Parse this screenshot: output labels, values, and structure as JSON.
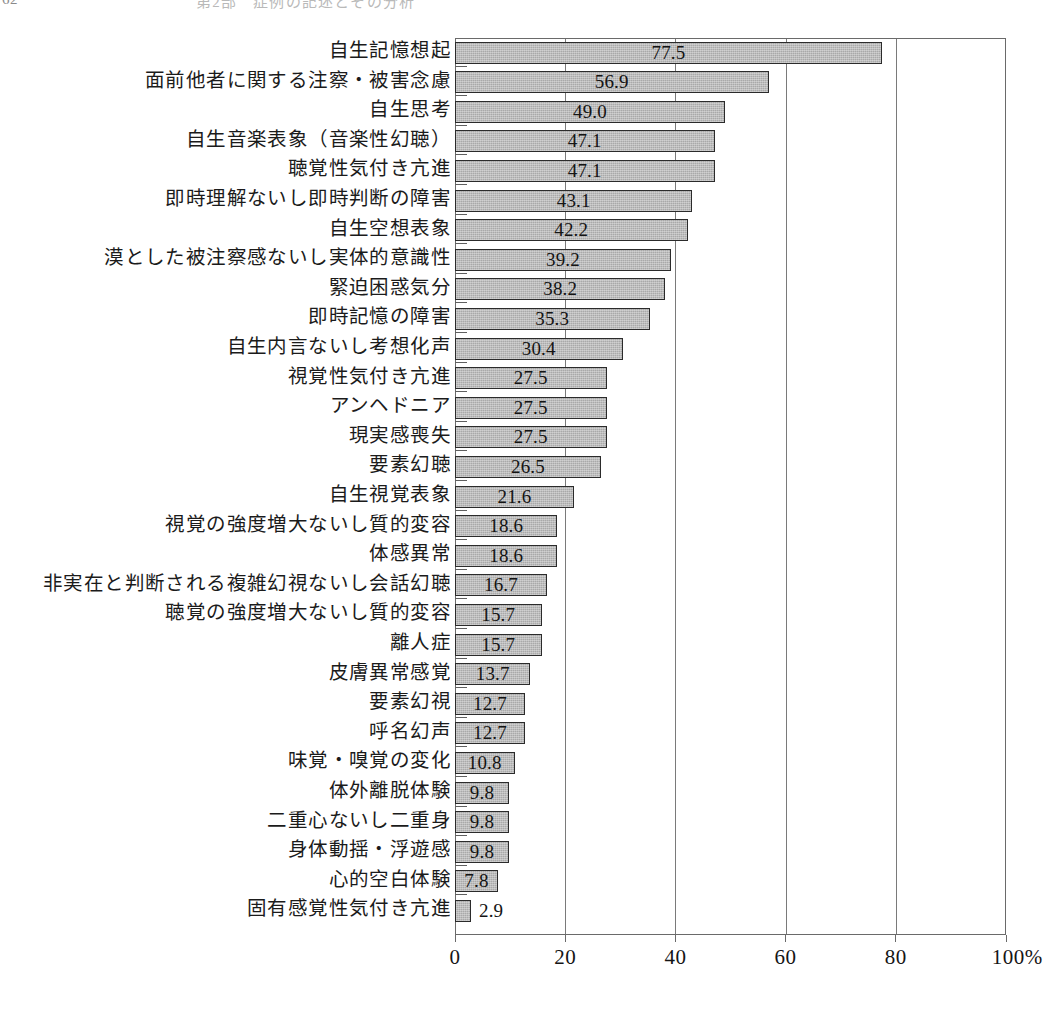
{
  "page_header": {
    "folio": "62",
    "running_title": "第2部　症例の記述とその分析"
  },
  "chart_data": {
    "type": "bar",
    "orientation": "horizontal",
    "title": "",
    "xlabel": "",
    "ylabel": "",
    "xlim": [
      0,
      100
    ],
    "xticks": [
      0,
      20,
      40,
      60,
      80,
      100
    ],
    "xtick_labels": [
      "0",
      "20",
      "40",
      "60",
      "80",
      "100%"
    ],
    "unit": "%",
    "grid": true,
    "grid_axis": "x",
    "legend": false,
    "bar_fill_color": "#a9a9a9",
    "bar_border_color": "#2b2b2b",
    "sorted": "descending",
    "categories": [
      "自生記憶想起",
      "面前他者に関する注察・被害念慮",
      "自生思考",
      "自生音楽表象（音楽性幻聴）",
      "聴覚性気付き亢進",
      "即時理解ないし即時判断の障害",
      "自生空想表象",
      "漠とした被注察感ないし実体的意識性",
      "緊迫困惑気分",
      "即時記憶の障害",
      "自生内言ないし考想化声",
      "視覚性気付き亢進",
      "アンヘドニア",
      "現実感喪失",
      "要素幻聴",
      "自生視覚表象",
      "視覚の強度増大ないし質的変容",
      "体感異常",
      "非実在と判断される複雑幻視ないし会話幻聴",
      "聴覚の強度増大ないし質的変容",
      "離人症",
      "皮膚異常感覚",
      "要素幻視",
      "呼名幻声",
      "味覚・嗅覚の変化",
      "体外離脱体験",
      "二重心ないし二重身",
      "身体動揺・浮遊感",
      "心的空白体験",
      "固有感覚性気付き亢進"
    ],
    "values": [
      77.5,
      56.9,
      49.0,
      47.1,
      47.1,
      43.1,
      42.2,
      39.2,
      38.2,
      35.3,
      30.4,
      27.5,
      27.5,
      27.5,
      26.5,
      21.6,
      18.6,
      18.6,
      16.7,
      15.7,
      15.7,
      13.7,
      12.7,
      12.7,
      10.8,
      9.8,
      9.8,
      9.8,
      7.8,
      2.9
    ],
    "value_labels": [
      "77.5",
      "56.9",
      "49.0",
      "47.1",
      "47.1",
      "43.1",
      "42.2",
      "39.2",
      "38.2",
      "35.3",
      "30.4",
      "27.5",
      "27.5",
      "27.5",
      "26.5",
      "21.6",
      "18.6",
      "18.6",
      "16.7",
      "15.7",
      "15.7",
      "13.7",
      "12.7",
      "12.7",
      "10.8",
      "9.8",
      "9.8",
      "9.8",
      "7.8",
      "2.9"
    ],
    "value_label_placement": [
      "inside",
      "inside",
      "inside",
      "inside",
      "inside",
      "inside",
      "inside",
      "inside",
      "inside",
      "inside",
      "inside",
      "inside",
      "inside",
      "inside",
      "inside",
      "inside",
      "inside",
      "inside",
      "inside",
      "inside",
      "inside",
      "inside",
      "inside",
      "inside",
      "inside",
      "inside",
      "inside",
      "inside",
      "inside",
      "outside"
    ]
  }
}
